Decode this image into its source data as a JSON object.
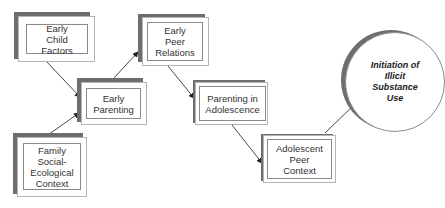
{
  "diagram": {
    "type": "flow",
    "nodes": [
      {
        "id": "early_child_factors",
        "label": "Early Child Factors"
      },
      {
        "id": "early_parenting",
        "label": "Early Parenting"
      },
      {
        "id": "family_context",
        "label": "Family Social-Ecological Context"
      },
      {
        "id": "early_peer_relations",
        "label": "Early Peer Relations"
      },
      {
        "id": "parenting_adolescence",
        "label": "Parenting in Adolescence"
      },
      {
        "id": "adolescent_peer_context",
        "label": "Adolescent Peer Context"
      },
      {
        "id": "initiation",
        "label": "Initiation of Illicit Substance Use"
      }
    ],
    "edges": [
      {
        "from": "early_child_factors",
        "to": "early_parenting"
      },
      {
        "from": "family_context",
        "to": "early_parenting"
      },
      {
        "from": "early_parenting",
        "to": "early_peer_relations"
      },
      {
        "from": "early_peer_relations",
        "to": "parenting_adolescence"
      },
      {
        "from": "parenting_adolescence",
        "to": "adolescent_peer_context"
      },
      {
        "from": "adolescent_peer_context",
        "to": "initiation"
      }
    ],
    "colors": {
      "shadow": "#6e6e6e",
      "border": "#8a8a8a",
      "text": "#333333",
      "arrow": "#222222"
    }
  }
}
